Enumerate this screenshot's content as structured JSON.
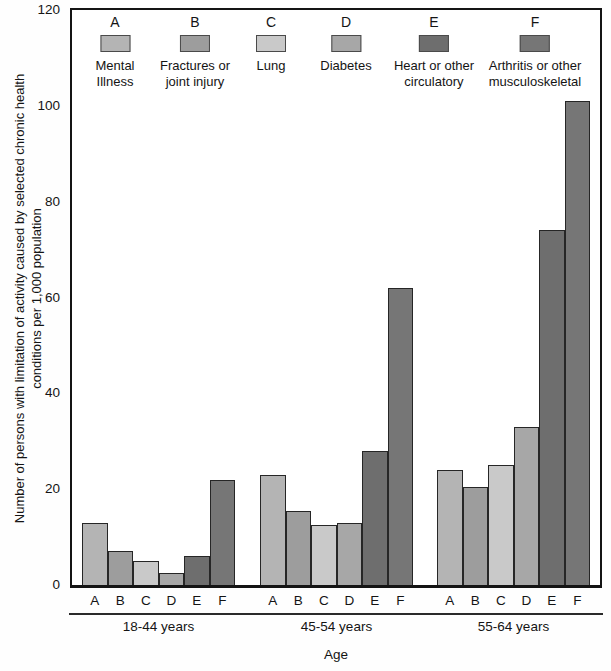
{
  "chart_data": {
    "type": "bar",
    "title": "",
    "xlabel": "Age",
    "ylabel": "Number of persons with limitation of activity caused by selected chronic health conditions per 1,000 population",
    "ylabel_lines": [
      "Number of persons with limitation of activity caused by selected chronic health",
      "conditions per 1,000 population"
    ],
    "ylim": [
      0,
      120
    ],
    "yticks": [
      0,
      20,
      40,
      60,
      80,
      100,
      120
    ],
    "grid": false,
    "legend_position": "top-inside-horizontal",
    "categories": [
      "18-44 years",
      "45-54 years",
      "55-64 years"
    ],
    "series": [
      {
        "key": "A",
        "name": "Mental Illness",
        "label_lines": [
          "Mental",
          "Illness"
        ],
        "color": "#b4b4b4",
        "values": [
          13,
          23,
          24
        ]
      },
      {
        "key": "B",
        "name": "Fractures or joint injury",
        "label_lines": [
          "Fractures or",
          "joint injury"
        ],
        "color": "#9d9d9d",
        "values": [
          7,
          15.5,
          20.5
        ]
      },
      {
        "key": "C",
        "name": "Lung",
        "label_lines": [
          "Lung"
        ],
        "color": "#c9c9c9",
        "values": [
          5,
          12.5,
          25
        ]
      },
      {
        "key": "D",
        "name": "Diabetes",
        "label_lines": [
          "Diabetes"
        ],
        "color": "#a7a7a7",
        "values": [
          2.5,
          13,
          33
        ]
      },
      {
        "key": "E",
        "name": "Heart or other circulatory",
        "label_lines": [
          "Heart or other",
          "circulatory"
        ],
        "color": "#6e6e6e",
        "values": [
          6,
          28,
          74
        ]
      },
      {
        "key": "F",
        "name": "Arthritis or other musculoskeletal",
        "label_lines": [
          "Arthritis or other",
          "musculoskeletal"
        ],
        "color": "#767676",
        "values": [
          22,
          62,
          101
        ]
      }
    ]
  }
}
